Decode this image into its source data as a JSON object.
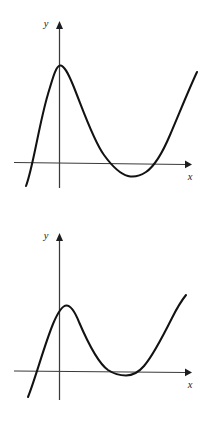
{
  "figure": {
    "background_color": "#ffffff",
    "curve_color": "#121212",
    "axis_color": "#3a3a3c",
    "label_color": "#1d1d1f",
    "panel_count": 2
  },
  "graphs": [
    {
      "id": "graph-top",
      "name": "cubic-with-negative-local-minimum",
      "x_axis_label": "x",
      "y_axis_label": "y",
      "description": "Cubic curve rising from lower left, local maximum above the y-axis, local minimum dipping below the x-axis, then rising to upper right.",
      "axes": {
        "x_axis": {
          "x_start": 14,
          "x_end": 186,
          "y_start": 162.5,
          "y_end": 164.5,
          "arrow_tip_x": 192,
          "arrow_tip_y": 164.6
        },
        "y_axis": {
          "x": 59.5,
          "y_bottom": 188,
          "y_top": 28,
          "arrow_tip_x": 59.5,
          "arrow_tip_y": 21
        }
      },
      "label_positions": {
        "x_label_x": 190,
        "x_label_y": 180,
        "y_label_x": 46,
        "y_label_y": 27
      },
      "key_points": {
        "left_end": {
          "x": 26,
          "y": 186
        },
        "left_x_intercept": {
          "x": 22.5,
          "y": 163
        },
        "local_max": {
          "x": 59,
          "y": 65
        },
        "mid_x_intercept": {
          "x": 118,
          "y": 163.5
        },
        "local_min": {
          "x": 136,
          "y": 176
        },
        "right_x_intercept": {
          "x": 156,
          "y": 164
        },
        "right_end": {
          "x": 197,
          "y": 72
        }
      },
      "path": "M 26,186 C 33,168 39,124 48,94 C 53,77 56,66 60,65.5 C 64,65 68,73 73,85 C 82,107 93,140 104,155 C 112,166 120,174 128,176 C 134,177.5 140,176 146,172 C 154,166.5 162,154 170,135 C 179,114 189,89 197,72"
    },
    {
      "id": "graph-bottom",
      "name": "cubic-tangent-to-x-axis-at-minimum",
      "x_axis_label": "x",
      "y_axis_label": "y",
      "description": "Cubic curve rising from lower left, local maximum above the y-axis, local minimum tangent to the x-axis, then rising steeply to upper right.",
      "axes": {
        "x_axis": {
          "x_start": 14,
          "x_end": 186,
          "y_start": 371,
          "y_end": 372.5,
          "arrow_tip_x": 192,
          "arrow_tip_y": 372.6
        },
        "y_axis": {
          "x": 59.5,
          "y_bottom": 400,
          "y_top": 240,
          "arrow_tip_x": 59.5,
          "arrow_tip_y": 233
        },
        "x_axis_local": {
          "y_start": 159,
          "y_end": 160.5
        },
        "y_axis_local": {
          "y_bottom": 188,
          "y_top": 28,
          "arrow_tip_y": 21
        }
      },
      "label_positions": {
        "x_label_x": 190,
        "x_label_y": 388,
        "y_label_x": 46,
        "y_label_y": 239
      },
      "key_points": {
        "left_end": {
          "x": 28,
          "y": 397
        },
        "left_x_intercept": {
          "x": 36,
          "y": 371
        },
        "local_max": {
          "x": 66,
          "y": 305
        },
        "tangent_min": {
          "x": 126,
          "y": 372
        },
        "right_end": {
          "x": 186,
          "y": 295
        }
      },
      "path": "M 28,397 C 35,380 44,346 53,324 C 58,312 62,305.5 66.5,305.5 C 71,305.5 75,312 79,322 C 88,343 98,363 108,370 C 114,374 120,375.5 126,375.5 C 132,375.5 138,373 144,366 C 153,355.5 163,336 172,318 C 178,306 182,300 186,295"
    }
  ]
}
